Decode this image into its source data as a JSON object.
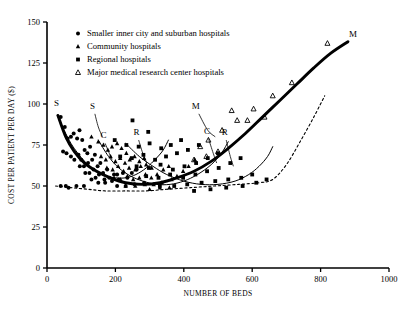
{
  "chart_data": {
    "type": "scatter",
    "title": "",
    "xlabel": "NUMBER OF BEDS",
    "ylabel": "COST PER PATIENT PER DAY ($)",
    "xlim": [
      0,
      1000
    ],
    "ylim": [
      0,
      150
    ],
    "xticks": [
      "0",
      "200",
      "400",
      "600",
      "800",
      "1000"
    ],
    "xtick_values": [
      0,
      200,
      400,
      600,
      800,
      1000
    ],
    "yticks": [
      "0",
      "25",
      "50",
      "75",
      "100",
      "125",
      "150"
    ],
    "ytick_values": [
      0,
      25,
      50,
      75,
      100,
      125,
      150
    ],
    "grid": false,
    "legend_position": "upper-center",
    "legend": [
      {
        "marker": "filled-circle",
        "label": "Smaller inner city and suburban hospitals"
      },
      {
        "marker": "filled-triangle",
        "label": "Community hospitals"
      },
      {
        "marker": "filled-square",
        "label": "Regional hospitals"
      },
      {
        "marker": "open-triangle",
        "label": "Major medical research center hospitals"
      }
    ],
    "series": [
      {
        "name": "Smaller inner city and suburban hospitals",
        "marker": "filled-circle",
        "points": [
          [
            40,
            92
          ],
          [
            52,
            86
          ],
          [
            60,
            79
          ],
          [
            47,
            71
          ],
          [
            57,
            70
          ],
          [
            70,
            80
          ],
          [
            78,
            82
          ],
          [
            88,
            79
          ],
          [
            95,
            84
          ],
          [
            103,
            78
          ],
          [
            70,
            68
          ],
          [
            80,
            66
          ],
          [
            92,
            69
          ],
          [
            100,
            66
          ],
          [
            110,
            72
          ],
          [
            118,
            70
          ],
          [
            126,
            74
          ],
          [
            96,
            62
          ],
          [
            108,
            62
          ],
          [
            120,
            64
          ],
          [
            132,
            66
          ],
          [
            140,
            69
          ],
          [
            112,
            58
          ],
          [
            124,
            58
          ],
          [
            136,
            60
          ],
          [
            148,
            62
          ],
          [
            156,
            64
          ],
          [
            130,
            54
          ],
          [
            142,
            55
          ],
          [
            152,
            57
          ],
          [
            164,
            58
          ],
          [
            176,
            60
          ],
          [
            168,
            54
          ],
          [
            182,
            55
          ],
          [
            196,
            57
          ],
          [
            40,
            50
          ],
          [
            55,
            50
          ],
          [
            63,
            49
          ],
          [
            86,
            50
          ],
          [
            108,
            50
          ],
          [
            150,
            52
          ],
          [
            170,
            52
          ],
          [
            190,
            53
          ],
          [
            210,
            54
          ],
          [
            235,
            55
          ],
          [
            205,
            57
          ],
          [
            222,
            58
          ],
          [
            248,
            58
          ],
          [
            262,
            60
          ],
          [
            205,
            50
          ],
          [
            230,
            50
          ],
          [
            256,
            51
          ],
          [
            284,
            52
          ]
        ]
      },
      {
        "name": "Community hospitals",
        "marker": "filled-triangle",
        "points": [
          [
            130,
            80
          ],
          [
            150,
            77
          ],
          [
            165,
            75
          ],
          [
            178,
            72
          ],
          [
            190,
            74
          ],
          [
            205,
            76
          ],
          [
            218,
            73
          ],
          [
            232,
            70
          ],
          [
            158,
            68
          ],
          [
            172,
            66
          ],
          [
            186,
            68
          ],
          [
            200,
            65
          ],
          [
            214,
            67
          ],
          [
            228,
            64
          ],
          [
            242,
            66
          ],
          [
            256,
            68
          ],
          [
            270,
            65
          ],
          [
            284,
            67
          ],
          [
            175,
            61
          ],
          [
            192,
            60
          ],
          [
            208,
            62
          ],
          [
            224,
            59
          ],
          [
            240,
            61
          ],
          [
            258,
            60
          ],
          [
            274,
            62
          ],
          [
            290,
            63
          ],
          [
            306,
            61
          ],
          [
            196,
            55
          ],
          [
            215,
            54
          ],
          [
            235,
            56
          ],
          [
            252,
            54
          ],
          [
            270,
            55
          ],
          [
            288,
            57
          ],
          [
            305,
            55
          ],
          [
            322,
            57
          ],
          [
            340,
            60
          ],
          [
            356,
            62
          ],
          [
            230,
            50
          ],
          [
            258,
            50
          ],
          [
            286,
            51
          ],
          [
            312,
            51
          ],
          [
            336,
            52
          ],
          [
            364,
            54
          ],
          [
            380,
            56
          ],
          [
            398,
            59
          ],
          [
            414,
            62
          ],
          [
            432,
            66
          ],
          [
            300,
            48
          ],
          [
            330,
            49
          ],
          [
            358,
            49
          ]
        ]
      },
      {
        "name": "Regional hospitals",
        "marker": "filled-square",
        "points": [
          [
            250,
            90
          ],
          [
            296,
            83
          ],
          [
            198,
            78
          ],
          [
            232,
            75
          ],
          [
            268,
            74
          ],
          [
            300,
            76
          ],
          [
            334,
            73
          ],
          [
            362,
            75
          ],
          [
            392,
            78
          ],
          [
            214,
            68
          ],
          [
            248,
            67
          ],
          [
            282,
            69
          ],
          [
            316,
            66
          ],
          [
            348,
            68
          ],
          [
            380,
            70
          ],
          [
            412,
            72
          ],
          [
            444,
            75
          ],
          [
            262,
            62
          ],
          [
            298,
            61
          ],
          [
            332,
            63
          ],
          [
            368,
            60
          ],
          [
            402,
            62
          ],
          [
            436,
            64
          ],
          [
            470,
            67
          ],
          [
            500,
            70
          ],
          [
            290,
            56
          ],
          [
            326,
            55
          ],
          [
            360,
            57
          ],
          [
            398,
            55
          ],
          [
            434,
            57
          ],
          [
            468,
            59
          ],
          [
            502,
            61
          ],
          [
            536,
            64
          ],
          [
            566,
            67
          ],
          [
            330,
            50
          ],
          [
            372,
            50
          ],
          [
            410,
            51
          ],
          [
            452,
            52
          ],
          [
            492,
            53
          ],
          [
            530,
            54
          ],
          [
            568,
            55
          ],
          [
            600,
            57
          ],
          [
            430,
            47
          ],
          [
            478,
            48
          ],
          [
            524,
            49
          ],
          [
            572,
            50
          ],
          [
            612,
            52
          ],
          [
            642,
            54
          ]
        ]
      },
      {
        "name": "Major medical research center hospitals",
        "marker": "open-triangle",
        "points": [
          [
            820,
            137
          ],
          [
            716,
            113
          ],
          [
            660,
            105
          ],
          [
            604,
            97
          ],
          [
            556,
            90
          ],
          [
            512,
            84
          ],
          [
            472,
            78
          ],
          [
            448,
            74
          ],
          [
            540,
            96
          ],
          [
            586,
            90
          ],
          [
            636,
            92
          ],
          [
            500,
            71
          ],
          [
            466,
            68
          ],
          [
            430,
            66
          ]
        ]
      }
    ],
    "curves": [
      {
        "label": "S",
        "label_position": "left-start",
        "description": "thin curve, smaller inner city and suburban hospitals, U-shaped",
        "style": "thin-solid",
        "points": [
          [
            30,
            93
          ],
          [
            50,
            84
          ],
          [
            70,
            76
          ],
          [
            90,
            70
          ],
          [
            110,
            65
          ],
          [
            130,
            61
          ],
          [
            150,
            58
          ],
          [
            175,
            56
          ],
          [
            200,
            55
          ],
          [
            230,
            55
          ],
          [
            260,
            57
          ],
          [
            290,
            61
          ],
          [
            320,
            67
          ],
          [
            340,
            72
          ],
          [
            355,
            78
          ]
        ]
      },
      {
        "label": "C",
        "label_position": "inner",
        "description": "thin curve, community hospitals",
        "style": "thin-solid",
        "points": [
          [
            150,
            78
          ],
          [
            180,
            68
          ],
          [
            210,
            61
          ],
          [
            245,
            56
          ],
          [
            280,
            53
          ],
          [
            320,
            51
          ],
          [
            360,
            51
          ],
          [
            400,
            53
          ],
          [
            440,
            57
          ],
          [
            480,
            63
          ],
          [
            510,
            70
          ],
          [
            530,
            77
          ]
        ]
      },
      {
        "label": "R",
        "label_position": "inner",
        "description": "thin curve, regional hospitals",
        "style": "thin-solid",
        "points": [
          [
            230,
            76
          ],
          [
            270,
            68
          ],
          [
            310,
            62
          ],
          [
            350,
            57
          ],
          [
            400,
            53
          ],
          [
            450,
            51
          ],
          [
            500,
            51
          ],
          [
            550,
            53
          ],
          [
            590,
            57
          ],
          [
            620,
            62
          ],
          [
            645,
            68
          ],
          [
            660,
            74
          ]
        ]
      },
      {
        "label": "M",
        "label_position": "right-end",
        "description": "heavy bold curve, major medical research center hospitals, U-shaped rising to right",
        "style": "thick-solid",
        "points": [
          [
            32,
            93
          ],
          [
            55,
            80
          ],
          [
            80,
            71
          ],
          [
            110,
            64
          ],
          [
            145,
            59
          ],
          [
            185,
            55
          ],
          [
            230,
            52
          ],
          [
            280,
            51
          ],
          [
            330,
            52
          ],
          [
            380,
            55
          ],
          [
            430,
            59
          ],
          [
            480,
            65
          ],
          [
            530,
            73
          ],
          [
            580,
            82
          ],
          [
            630,
            92
          ],
          [
            680,
            102
          ],
          [
            730,
            112
          ],
          [
            780,
            122
          ],
          [
            830,
            131
          ],
          [
            880,
            138
          ]
        ]
      },
      {
        "label": "",
        "description": "dashed lower envelope curve",
        "style": "dashed",
        "points": [
          [
            25,
            50
          ],
          [
            70,
            49
          ],
          [
            120,
            48
          ],
          [
            170,
            47
          ],
          [
            230,
            47
          ],
          [
            290,
            47
          ],
          [
            350,
            48
          ],
          [
            420,
            49
          ],
          [
            490,
            50
          ],
          [
            560,
            51
          ],
          [
            620,
            52
          ],
          [
            660,
            54
          ],
          [
            700,
            63
          ],
          [
            740,
            77
          ],
          [
            780,
            92
          ],
          [
            812,
            105
          ]
        ]
      }
    ],
    "curve_labels": [
      {
        "text": "S",
        "x": 28,
        "y": 99,
        "leader": false
      },
      {
        "text": "S",
        "x": 133,
        "y": 97,
        "leader": true
      },
      {
        "text": "C",
        "x": 165,
        "y": 79,
        "leader": true
      },
      {
        "text": "R",
        "x": 262,
        "y": 81,
        "leader": true
      },
      {
        "text": "M",
        "x": 435,
        "y": 97,
        "leader": true
      },
      {
        "text": "C",
        "x": 468,
        "y": 82,
        "leader": true
      },
      {
        "text": "R",
        "x": 520,
        "y": 81,
        "leader": true
      },
      {
        "text": "M",
        "x": 895,
        "y": 141,
        "leader": false
      }
    ]
  }
}
